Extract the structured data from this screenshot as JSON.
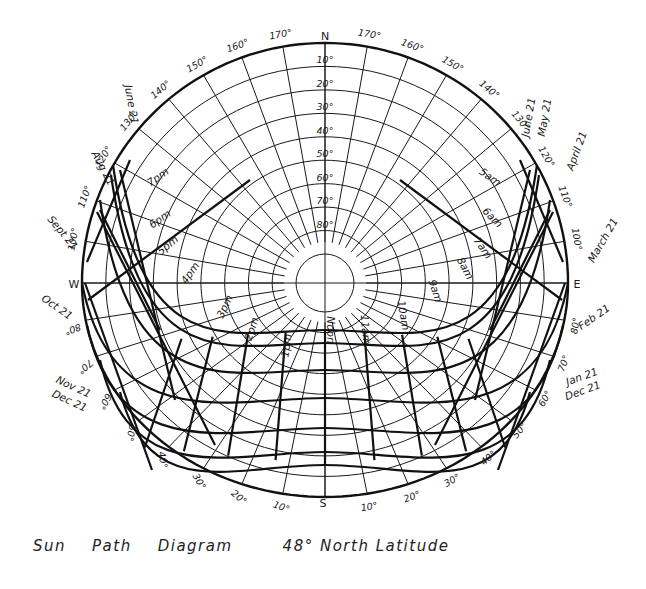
{
  "diagram": {
    "subtitle": "48° North Latitude",
    "caption_words": [
      "Sun",
      "Path",
      "Diagram",
      "48° North Latitude"
    ],
    "cardinals": {
      "north": "N",
      "south": "S",
      "east": "E",
      "west": "W"
    },
    "altitude_labels": [
      "10°",
      "20°",
      "30°",
      "40°",
      "50°",
      "60°",
      "70°",
      "80°"
    ],
    "azimuth_labels_top_left": [
      "170°",
      "160°",
      "150°",
      "140°",
      "130°",
      "120°",
      "110°",
      "100°"
    ],
    "azimuth_labels_top_right": [
      "170°",
      "160°",
      "150°",
      "140°",
      "130°",
      "120°",
      "110°",
      "100°"
    ],
    "azimuth_labels_bottom_left": [
      "80°",
      "70°",
      "60°",
      "50°",
      "40°",
      "30°",
      "20°",
      "10°"
    ],
    "azimuth_labels_bottom_right": [
      "80°",
      "70°",
      "60°",
      "50°",
      "40°",
      "30°",
      "20°",
      "10°"
    ],
    "date_labels_left": [
      "June 21",
      "Aug 21",
      "Sept 21",
      "Oct 21",
      "Nov 21",
      "Dec 21"
    ],
    "date_labels_right": [
      "June 21",
      "May 21",
      "April 21",
      "March 21",
      "Feb 21",
      "Jan 21",
      "Dec 21"
    ],
    "hour_labels_pm": [
      "7pm",
      "6pm",
      "5pm",
      "4pm",
      "3pm",
      "2pm",
      "1pm"
    ],
    "hour_labels_am": [
      "5am",
      "6am",
      "7am",
      "8am",
      "9am",
      "10am",
      "11am"
    ],
    "noon_label": "Noon",
    "line_color": "#111111",
    "background": "#ffffff"
  }
}
